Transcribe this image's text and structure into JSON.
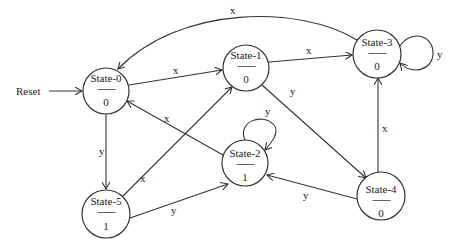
{
  "diagram": {
    "type": "state-machine",
    "reset_label": "Reset",
    "separator": "---------",
    "states": [
      {
        "id": "State-0",
        "name": "State-0",
        "output": "0",
        "cx": 106,
        "cy": 91,
        "r": 23
      },
      {
        "id": "State-1",
        "name": "State-1",
        "output": "0",
        "cx": 246,
        "cy": 68,
        "r": 23
      },
      {
        "id": "State-2",
        "name": "State-2",
        "output": "1",
        "cx": 245,
        "cy": 163,
        "r": 23
      },
      {
        "id": "State-3",
        "name": "State-3",
        "output": "0",
        "cx": 377,
        "cy": 54,
        "r": 24
      },
      {
        "id": "State-4",
        "name": "State-4",
        "output": "0",
        "cx": 381,
        "cy": 196,
        "r": 24
      },
      {
        "id": "State-5",
        "name": "State-5",
        "output": "1",
        "cx": 106,
        "cy": 214,
        "r": 24
      }
    ],
    "transitions": [
      {
        "from": "Reset",
        "to": "State-0",
        "label": ""
      },
      {
        "from": "State-0",
        "to": "State-1",
        "label": "x"
      },
      {
        "from": "State-0",
        "to": "State-5",
        "label": "y"
      },
      {
        "from": "State-1",
        "to": "State-3",
        "label": "x"
      },
      {
        "from": "State-1",
        "to": "State-4",
        "label": "y"
      },
      {
        "from": "State-2",
        "to": "State-0",
        "label": "x"
      },
      {
        "from": "State-2",
        "to": "State-2",
        "label": "y"
      },
      {
        "from": "State-3",
        "to": "State-0",
        "label": "x"
      },
      {
        "from": "State-3",
        "to": "State-3",
        "label": "y"
      },
      {
        "from": "State-4",
        "to": "State-3",
        "label": "x"
      },
      {
        "from": "State-4",
        "to": "State-2",
        "label": "y"
      },
      {
        "from": "State-5",
        "to": "State-1",
        "label": "x"
      },
      {
        "from": "State-5",
        "to": "State-2",
        "label": "y"
      }
    ]
  }
}
